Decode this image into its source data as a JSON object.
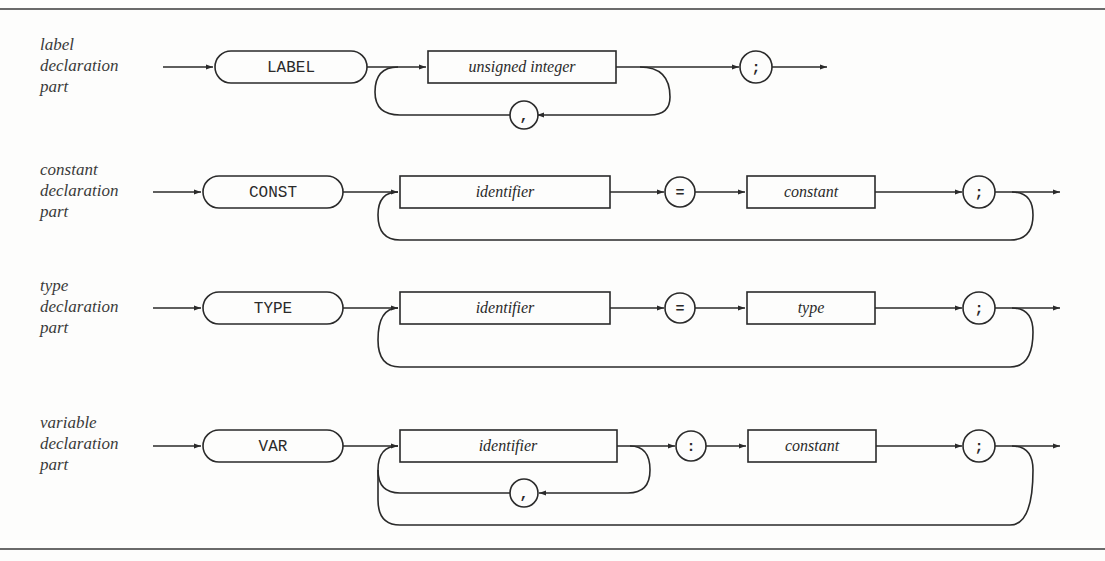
{
  "diagram": {
    "type": "syntax-diagram",
    "rows": [
      {
        "label": [
          "label",
          "declaration",
          "part"
        ],
        "keyword": "LABEL",
        "elements": [
          {
            "kind": "nonterminal",
            "text": "unsigned integer"
          },
          {
            "kind": "terminal",
            "text": ";"
          }
        ],
        "loop_separator": ","
      },
      {
        "label": [
          "constant",
          "declaration",
          "part"
        ],
        "keyword": "CONST",
        "elements": [
          {
            "kind": "nonterminal",
            "text": "identifier"
          },
          {
            "kind": "terminal",
            "text": "="
          },
          {
            "kind": "nonterminal",
            "text": "constant"
          },
          {
            "kind": "terminal",
            "text": ";"
          }
        ]
      },
      {
        "label": [
          "type",
          "declaration",
          "part"
        ],
        "keyword": "TYPE",
        "elements": [
          {
            "kind": "nonterminal",
            "text": "identifier"
          },
          {
            "kind": "terminal",
            "text": "="
          },
          {
            "kind": "nonterminal",
            "text": "type"
          },
          {
            "kind": "terminal",
            "text": ";"
          }
        ]
      },
      {
        "label": [
          "variable",
          "declaration",
          "part"
        ],
        "keyword": "VAR",
        "elements": [
          {
            "kind": "nonterminal",
            "text": "identifier"
          },
          {
            "kind": "terminal",
            "text": ":"
          },
          {
            "kind": "nonterminal",
            "text": "constant"
          },
          {
            "kind": "terminal",
            "text": ";"
          }
        ],
        "loop_separator": ","
      }
    ]
  }
}
